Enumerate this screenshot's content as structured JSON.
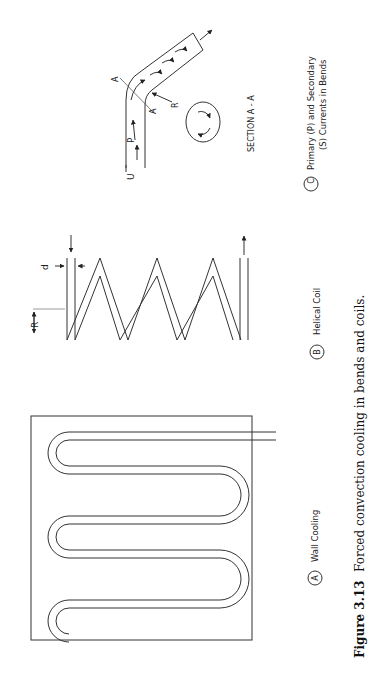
{
  "figure": {
    "number": "Figure 3.13",
    "caption": "Forced convection cooling in bends and coils."
  },
  "panels": [
    {
      "id": "A",
      "badge": "A",
      "title": "Wall Cooling",
      "dimension_labels": {
        "diameter": "d",
        "radius": "R"
      }
    },
    {
      "id": "B",
      "badge": "B",
      "title": "Helical Coil",
      "dimension_labels": {
        "diameter": "d",
        "radius": "R"
      }
    },
    {
      "id": "C",
      "badge": "C",
      "title_line1": "Primary (P) and Secondary",
      "title_line2": "(S) Currents in Bends",
      "labels": {
        "velocity": "U",
        "primary": "P",
        "radius": "R",
        "section_marker": "A",
        "section_title": "SECTION A - A"
      }
    }
  ],
  "colors": {
    "line": "#333333",
    "text": "#222222",
    "background": "#ffffff"
  }
}
